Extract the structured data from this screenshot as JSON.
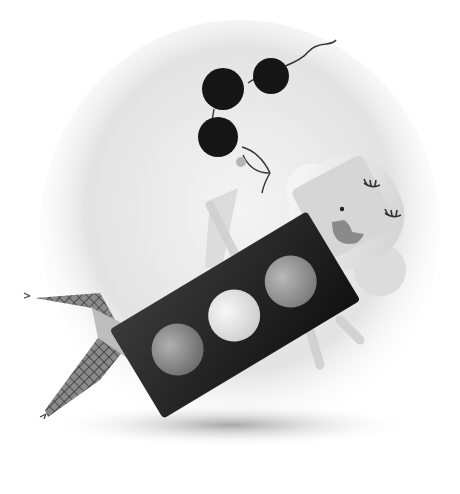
{
  "illustration": {
    "description": "Grayscale stylized figure reclining with a traffic-light torso, fishnet legs, sleepy face and black beads on wavy strings",
    "colors": {
      "background": "#ffffff",
      "blob": "#e6e6e6",
      "body_dark": "#1e1e1e",
      "light_red": "#8f8f8f",
      "light_yellow": "#e2e2e2",
      "light_green": "#9a9a9a",
      "beads": "#161616",
      "face": "#d4d4d4",
      "head": "#efefef",
      "shadow": "#9c9c9c"
    }
  }
}
